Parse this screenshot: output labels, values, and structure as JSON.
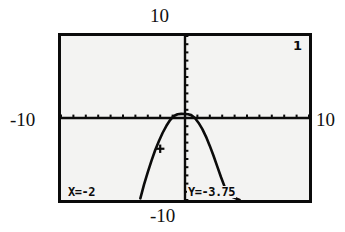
{
  "device": {
    "type": "graphing-calculator-screen",
    "graph_number": "1"
  },
  "outer_labels": {
    "top": "10",
    "bottom": "-10",
    "left": "-10",
    "right": "10"
  },
  "trace": {
    "x_readout": "X=-2",
    "y_readout": "Y=-3.75",
    "x_value": -2,
    "y_value": -3.75,
    "cursor_visible": true
  },
  "colors": {
    "screen_background": "#f3f3f2",
    "ink": "#0b0b0b",
    "page_background": "#ffffff",
    "border": "#0b0b0b"
  },
  "chart_data": {
    "type": "line",
    "title": "",
    "subtitle": "",
    "xlabel": "",
    "ylabel": "",
    "xlim": [
      -10,
      10
    ],
    "ylim": [
      -10,
      10
    ],
    "xscl": 1,
    "yscl": 1,
    "grid": false,
    "legend": null,
    "axes_visible": true,
    "tick_marks": true,
    "annotations": [
      {
        "name": "graph-number",
        "text": "1",
        "position": "top-right"
      },
      {
        "name": "trace-x",
        "text": "X=-2",
        "position": "bottom-left"
      },
      {
        "name": "trace-y",
        "text": "Y=-3.75",
        "position": "bottom-center"
      }
    ],
    "series": [
      {
        "name": "parabola",
        "kind": "curve",
        "equation_shape": "downward-opening parabola",
        "vertex": [
          0.25,
          0.45
        ],
        "x": [
          -3.6,
          -3.3,
          -3.0,
          -2.7,
          -2.4,
          -2.1,
          -1.8,
          -1.5,
          -1.2,
          -0.9,
          -0.6,
          -0.3,
          0.0,
          0.25,
          0.5,
          0.8,
          1.1,
          1.4,
          1.7,
          2.0,
          2.3,
          2.6,
          2.9,
          3.2,
          3.5,
          3.8,
          4.1,
          4.4
        ],
        "y": [
          -9.8,
          -8.1,
          -6.6,
          -5.2,
          -3.9,
          -2.8,
          -1.8,
          -0.95,
          -0.25,
          0.25,
          0.45,
          0.5,
          0.48,
          0.45,
          0.35,
          0.0,
          -0.6,
          -1.35,
          -2.3,
          -3.4,
          -4.6,
          -5.9,
          -7.2,
          -8.4,
          -9.2,
          -9.6,
          -9.8,
          -10.0
        ]
      },
      {
        "name": "trace-cursor",
        "kind": "marker",
        "x": [
          -2
        ],
        "y": [
          -3.75
        ]
      }
    ]
  }
}
